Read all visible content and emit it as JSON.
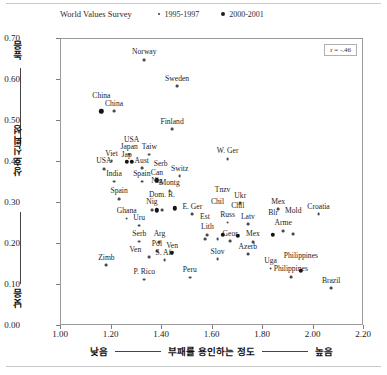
{
  "header": {
    "survey_title": "World Values Survey",
    "legend": [
      {
        "label": "1995-1997",
        "marker": "small-dot-icon"
      },
      {
        "label": "2000-2001",
        "marker": "large-dot-icon"
      }
    ]
  },
  "annotation": {
    "correlation": "r = -.46"
  },
  "axes": {
    "y_title": "상호신뢰성",
    "y_high": "높음",
    "y_low": "낮음",
    "y_ticks": [
      "0.00",
      "0.10",
      "0.20",
      "0.30",
      "0.40",
      "0.50",
      "0.60",
      "0.70"
    ],
    "x_title": "부패를 용인하는 정도",
    "x_low": "낮음",
    "x_high": "높음",
    "x_ticks": [
      "1.00",
      "1.20",
      "1.40",
      "1.60",
      "1.80",
      "2.00",
      "2.20"
    ]
  },
  "chart_data": {
    "type": "scatter",
    "title": "World Values Survey",
    "xlabel": "부패를 용인하는 정도 (낮음 — 높음)",
    "ylabel": "상호신뢰성 (낮음 — 높음)",
    "xlim": [
      1.0,
      2.2
    ],
    "ylim": [
      0.0,
      0.7
    ],
    "grid": false,
    "legend_position": "top-right",
    "annotation": "r = -.46",
    "series": [
      {
        "name": "1995-1997",
        "marker": "small",
        "points": [
          {
            "label": "Norway",
            "x": 1.33,
            "y": 0.649
          },
          {
            "label": "Sweden",
            "x": 1.46,
            "y": 0.585
          },
          {
            "label": "China",
            "x": 1.21,
            "y": 0.524
          },
          {
            "label": "Finland",
            "x": 1.44,
            "y": 0.48
          },
          {
            "label": "Japan",
            "x": 1.27,
            "y": 0.418
          },
          {
            "label": "Taiw",
            "x": 1.35,
            "y": 0.418
          },
          {
            "label": "W. Ger",
            "x": 1.66,
            "y": 0.408
          },
          {
            "label": "Viet",
            "x": 1.2,
            "y": 0.402
          },
          {
            "label": "Aust",
            "x": 1.32,
            "y": 0.385
          },
          {
            "label": "USA",
            "x": 1.17,
            "y": 0.383
          },
          {
            "label": "India",
            "x": 1.21,
            "y": 0.352
          },
          {
            "label": "Spain",
            "x": 1.32,
            "y": 0.352
          },
          {
            "label": "Switz",
            "x": 1.47,
            "y": 0.365
          },
          {
            "label": "Spain",
            "x": 1.23,
            "y": 0.31
          },
          {
            "label": "Montg",
            "x": 1.43,
            "y": 0.33
          },
          {
            "label": "Nig",
            "x": 1.36,
            "y": 0.283
          },
          {
            "label": "Dom. R.",
            "x": 1.4,
            "y": 0.283
          },
          {
            "label": "Ghana",
            "x": 1.26,
            "y": 0.262
          },
          {
            "label": "E. Ger",
            "x": 1.52,
            "y": 0.272
          },
          {
            "label": "Uru",
            "x": 1.31,
            "y": 0.245
          },
          {
            "label": "Russ",
            "x": 1.66,
            "y": 0.252
          },
          {
            "label": "Latv",
            "x": 1.74,
            "y": 0.248
          },
          {
            "label": "Ukr",
            "x": 1.71,
            "y": 0.3
          },
          {
            "label": "Mex",
            "x": 1.86,
            "y": 0.285
          },
          {
            "label": "Croatia",
            "x": 2.02,
            "y": 0.272
          },
          {
            "label": "Arme",
            "x": 1.88,
            "y": 0.232
          },
          {
            "label": "Mold",
            "x": 1.92,
            "y": 0.225
          },
          {
            "label": "Lith",
            "x": 1.58,
            "y": 0.222
          },
          {
            "label": "Est",
            "x": 1.57,
            "y": 0.212
          },
          {
            "label": "Chil",
            "x": 1.62,
            "y": 0.212
          },
          {
            "label": "Geor",
            "x": 1.67,
            "y": 0.207
          },
          {
            "label": "Mex",
            "x": 1.76,
            "y": 0.205
          },
          {
            "label": "Azerb",
            "x": 1.74,
            "y": 0.175
          },
          {
            "label": "Serb",
            "x": 1.31,
            "y": 0.206
          },
          {
            "label": "Arg",
            "x": 1.39,
            "y": 0.205
          },
          {
            "label": "Pol",
            "x": 1.38,
            "y": 0.182
          },
          {
            "label": "Ven",
            "x": 1.35,
            "y": 0.168
          },
          {
            "label": "S. Afr",
            "x": 1.41,
            "y": 0.16
          },
          {
            "label": "Slov",
            "x": 1.62,
            "y": 0.163
          },
          {
            "label": "Zimb",
            "x": 1.18,
            "y": 0.148
          },
          {
            "label": "Uga",
            "x": 1.83,
            "y": 0.14
          },
          {
            "label": "Peru",
            "x": 1.51,
            "y": 0.118
          },
          {
            "label": "P. Rico",
            "x": 1.33,
            "y": 0.113
          },
          {
            "label": "Philippines",
            "x": 1.91,
            "y": 0.12
          },
          {
            "label": "Brazil",
            "x": 2.07,
            "y": 0.092
          }
        ]
      },
      {
        "name": "2000-2001",
        "marker": "large",
        "points": [
          {
            "label": "China",
            "x": 1.16,
            "y": 0.524
          },
          {
            "label": "Jap",
            "x": 1.26,
            "y": 0.4
          },
          {
            "label": "USA",
            "x": 1.28,
            "y": 0.4
          },
          {
            "label": "Can",
            "x": 1.38,
            "y": 0.355
          },
          {
            "label": "Nig",
            "x": 1.38,
            "y": 0.282
          },
          {
            "label": "Serb",
            "x": 1.45,
            "y": 0.287
          },
          {
            "label": "Tnzv",
            "x": 1.64,
            "y": 0.222
          },
          {
            "label": "Blr",
            "x": 1.84,
            "y": 0.222
          },
          {
            "label": "Chil",
            "x": 1.7,
            "y": 0.22
          },
          {
            "label": "Ven",
            "x": 1.44,
            "y": 0.178
          },
          {
            "label": "Philippines",
            "x": 1.95,
            "y": 0.135
          }
        ]
      }
    ]
  }
}
